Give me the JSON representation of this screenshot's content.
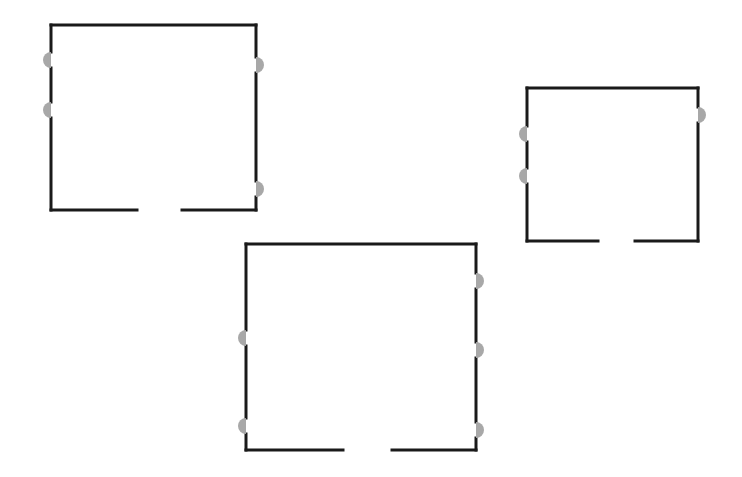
{
  "canvas": {
    "width": 742,
    "height": 477,
    "background": "#ffffff"
  },
  "style": {
    "wall_color": "#1a1a1a",
    "wall_width": 3,
    "door_color": "#a8a8a8",
    "door_radius": 8
  },
  "rooms": [
    {
      "id": "room-1",
      "x1": 51,
      "y1": 25,
      "x2": 256,
      "y2": 210,
      "bottom_gap": [
        137,
        182
      ],
      "left_doors": [
        60,
        110
      ],
      "right_doors": [
        65,
        189
      ]
    },
    {
      "id": "room-2",
      "x1": 527,
      "y1": 88,
      "x2": 698,
      "y2": 241,
      "bottom_gap": [
        598,
        635
      ],
      "left_doors": [
        134,
        176
      ],
      "right_doors": [
        115
      ]
    },
    {
      "id": "room-3",
      "x1": 246,
      "y1": 244,
      "x2": 476,
      "y2": 450,
      "bottom_gap": [
        343,
        392
      ],
      "left_doors": [
        338,
        426
      ],
      "right_doors": [
        281,
        350,
        430
      ]
    }
  ]
}
